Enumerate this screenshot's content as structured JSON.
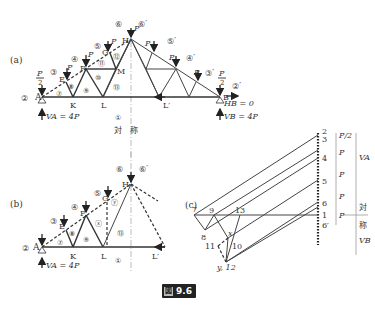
{
  "figure": {
    "caption_prefix": "図",
    "caption_number": "9.6"
  },
  "panel_a": {
    "label": "(a)",
    "nodes": {
      "A": "A",
      "E": "E",
      "F": "F",
      "G": "G",
      "H": "H",
      "K": "K",
      "L": "L",
      "M": "M",
      "B": "B",
      "Lp": "L′"
    },
    "loads": {
      "end": "P",
      "end_den": "2",
      "mid": "P"
    },
    "regions": [
      "②",
      "③",
      "④",
      "⑤",
      "⑥",
      "⑦",
      "⑧",
      "⑨",
      "⑩",
      "⑪",
      "⑫",
      "⑬",
      "①"
    ],
    "regions_mirror": [
      "⑥′",
      "⑤′",
      "④′",
      "③′",
      "②′"
    ],
    "reaction_A": "VA = 4P",
    "reaction_B_v": "VB = 4P",
    "reaction_B_h": "HB = 0",
    "symmetry_label": "対　称"
  },
  "panel_b": {
    "label": "(b)",
    "nodes": {
      "A": "A",
      "E": "E",
      "F": "F",
      "G": "G",
      "H": "H",
      "K": "K",
      "L": "L",
      "Lp": "L′"
    },
    "regions": [
      "②",
      "③",
      "④",
      "⑤",
      "⑥",
      "⑦",
      "⑧",
      "⑨",
      "ⓧ",
      "ⓨ",
      "⑬",
      "①",
      "⑥′"
    ],
    "reaction_A": "VA = 4P"
  },
  "panel_c": {
    "label": "(c)",
    "points": [
      "7",
      "9",
      "13",
      "8",
      "x",
      "11",
      "10",
      "y, 12"
    ],
    "load_line_points": [
      "2",
      "3",
      "4",
      "5",
      "6",
      "1",
      "6′"
    ],
    "load_segments": [
      "P/2",
      "P",
      "P",
      "P",
      "P"
    ],
    "reaction_labels": [
      "VA",
      "VB"
    ],
    "symmetry_label": [
      "対",
      "称"
    ]
  }
}
